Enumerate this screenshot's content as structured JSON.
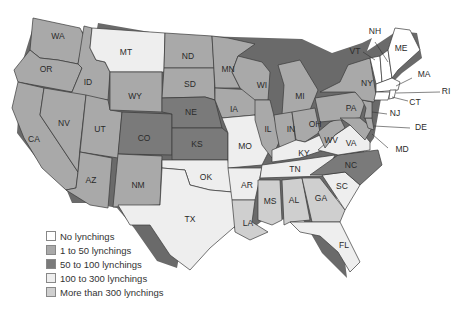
{
  "legend": [
    {
      "key": "none",
      "label": "No lynchings",
      "color": "#ffffff"
    },
    {
      "key": "low",
      "label": "1 to 50 lynchings",
      "color": "#a9a9a9"
    },
    {
      "key": "mid",
      "label": "50 to 100 lynchings",
      "color": "#7a7a7a"
    },
    {
      "key": "high",
      "label": "100 to 300 lynchings",
      "color": "#eeeeee"
    },
    {
      "key": "top",
      "label": "More than 300 lynchings",
      "color": "#cfcfcf"
    }
  ],
  "states": {
    "WA": {
      "label": "WA",
      "category": "low"
    },
    "OR": {
      "label": "OR",
      "category": "low"
    },
    "CA": {
      "label": "CA",
      "category": "low"
    },
    "ID": {
      "label": "ID",
      "category": "low"
    },
    "NV": {
      "label": "NV",
      "category": "low"
    },
    "UT": {
      "label": "UT",
      "category": "low"
    },
    "AZ": {
      "label": "AZ",
      "category": "low"
    },
    "MT": {
      "label": "MT",
      "category": "high"
    },
    "WY": {
      "label": "WY",
      "category": "low"
    },
    "CO": {
      "label": "CO",
      "category": "mid"
    },
    "NM": {
      "label": "NM",
      "category": "low"
    },
    "ND": {
      "label": "ND",
      "category": "low"
    },
    "SD": {
      "label": "SD",
      "category": "low"
    },
    "NE": {
      "label": "NE",
      "category": "mid"
    },
    "KS": {
      "label": "KS",
      "category": "mid"
    },
    "OK": {
      "label": "OK",
      "category": "high"
    },
    "TX": {
      "label": "TX",
      "category": "high"
    },
    "MN": {
      "label": "MN",
      "category": "low"
    },
    "IA": {
      "label": "IA",
      "category": "low"
    },
    "MO": {
      "label": "MO",
      "category": "high"
    },
    "AR": {
      "label": "AR",
      "category": "high"
    },
    "LA": {
      "label": "LA",
      "category": "top"
    },
    "WI": {
      "label": "WI",
      "category": "low"
    },
    "IL": {
      "label": "IL",
      "category": "low"
    },
    "MI": {
      "label": "MI",
      "category": "low"
    },
    "IN": {
      "label": "IN",
      "category": "low"
    },
    "OH": {
      "label": "OH",
      "category": "low"
    },
    "KY": {
      "label": "KY",
      "category": "high"
    },
    "TN": {
      "label": "TN",
      "category": "high"
    },
    "MS": {
      "label": "MS",
      "category": "top"
    },
    "AL": {
      "label": "AL",
      "category": "top"
    },
    "GA": {
      "label": "GA",
      "category": "top"
    },
    "FL": {
      "label": "FL",
      "category": "high"
    },
    "SC": {
      "label": "SC",
      "category": "high"
    },
    "NC": {
      "label": "NC",
      "category": "mid"
    },
    "VA": {
      "label": "VA",
      "category": "high"
    },
    "WV": {
      "label": "WV",
      "category": "low"
    },
    "PA": {
      "label": "PA",
      "category": "low"
    },
    "NY": {
      "label": "NY",
      "category": "low"
    },
    "NJ": {
      "label": "NJ",
      "category": "low"
    },
    "DE": {
      "label": "DE",
      "category": "low"
    },
    "MD": {
      "label": "MD",
      "category": "low"
    },
    "VT": {
      "label": "VT",
      "category": "none"
    },
    "NH": {
      "label": "NH",
      "category": "none"
    },
    "ME": {
      "label": "ME",
      "category": "none"
    },
    "MA": {
      "label": "MA",
      "category": "none"
    },
    "RI": {
      "label": "RI",
      "category": "none"
    },
    "CT": {
      "label": "CT",
      "category": "none"
    }
  }
}
